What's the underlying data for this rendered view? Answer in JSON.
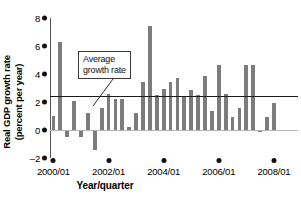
{
  "chart_data": {
    "type": "bar",
    "title": "",
    "subtitle": "",
    "xlabel": "Year/quarter",
    "ylabel": "Real GDP growth rate\n(percent per year)",
    "ylim": [
      -2,
      8
    ],
    "yticks": [
      -2,
      0,
      2,
      4,
      6,
      8
    ],
    "ytick_labels": [
      "–2",
      "0",
      "2",
      "4",
      "6",
      "8"
    ],
    "xtick_labels": [
      "2000/01",
      "2002/01",
      "2004/01",
      "2006/01",
      "2008/01"
    ],
    "xtick_positions": [
      0,
      8,
      16,
      24,
      32
    ],
    "grid": false,
    "legend": "none",
    "bar_color": "#7c7c7c",
    "average_line_color": "#1a1a1a",
    "zero_line_color": "#b8b8b8",
    "categories": [
      "2000/01",
      "2000/02",
      "2000/03",
      "2000/04",
      "2001/01",
      "2001/02",
      "2001/03",
      "2001/04",
      "2002/01",
      "2002/02",
      "2002/03",
      "2002/04",
      "2003/01",
      "2003/02",
      "2003/03",
      "2003/04",
      "2004/01",
      "2004/02",
      "2004/03",
      "2004/04",
      "2005/01",
      "2005/02",
      "2005/03",
      "2005/04",
      "2006/01",
      "2006/02",
      "2006/03",
      "2006/04",
      "2007/01",
      "2007/02",
      "2007/03",
      "2007/04",
      "2008/01",
      "2008/02",
      "2008/03",
      "2008/04"
    ],
    "values": [
      1.0,
      6.3,
      -0.5,
      2.1,
      -0.5,
      1.25,
      -1.4,
      1.6,
      2.6,
      2.2,
      2.2,
      0.2,
      1.25,
      3.4,
      7.4,
      2.5,
      2.9,
      3.4,
      3.7,
      2.45,
      2.85,
      2.5,
      3.85,
      1.35,
      4.65,
      2.6,
      0.9,
      1.55,
      4.65,
      4.65,
      -0.15,
      0.95,
      1.9,
      0.0,
      0.0,
      0.0
    ],
    "average_growth_rate": 2.45,
    "annotation": {
      "text": "Average\ngrowth rate",
      "target_value": 2.45
    }
  },
  "axis": {
    "y_title": "Real GDP growth rate\n(percent per year)",
    "x_title": "Year/quarter"
  }
}
